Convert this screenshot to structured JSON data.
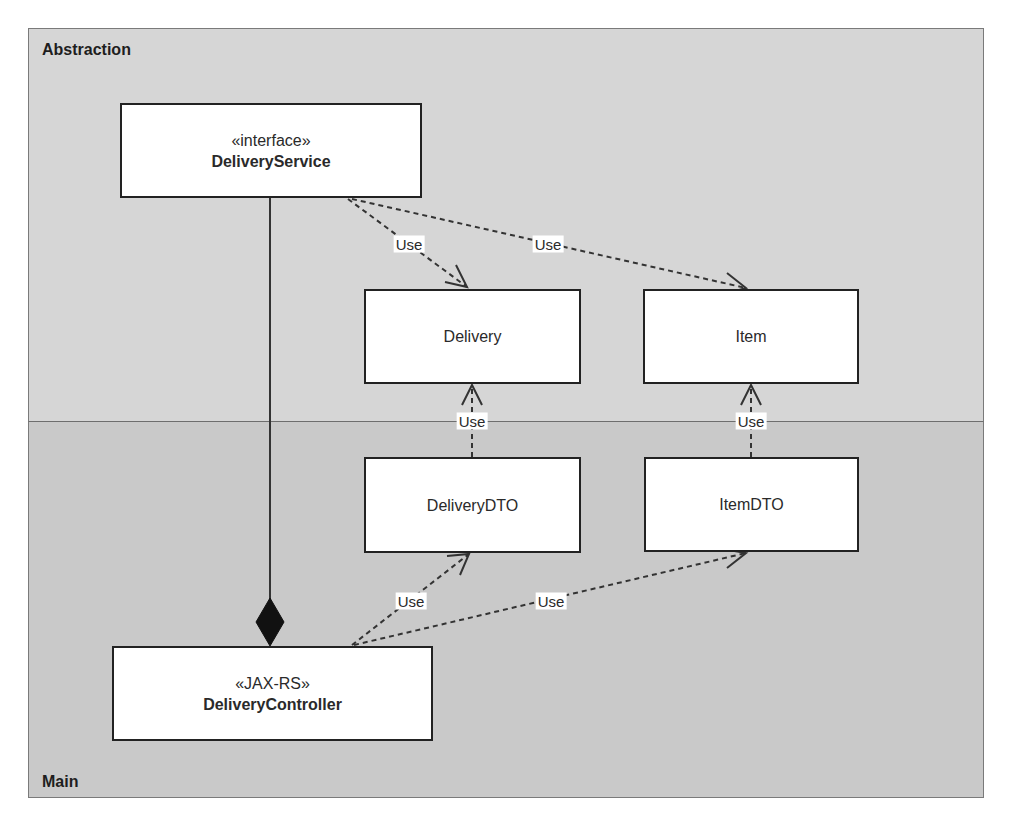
{
  "diagram": {
    "type": "UML class diagram",
    "packages": [
      {
        "id": "abstraction",
        "label": "Abstraction",
        "fill": "#d6d6d6"
      },
      {
        "id": "main",
        "label": "Main",
        "fill": "#c9c9c9"
      }
    ],
    "classes": {
      "delivery_service": {
        "stereotype": "«interface»",
        "name": "DeliveryService",
        "package": "Abstraction"
      },
      "delivery": {
        "name": "Delivery",
        "package": "Abstraction"
      },
      "item": {
        "name": "Item",
        "package": "Abstraction"
      },
      "delivery_dto": {
        "name": "DeliveryDTO",
        "package": "Main"
      },
      "item_dto": {
        "name": "ItemDTO",
        "package": "Main"
      },
      "delivery_controller": {
        "stereotype": "«JAX-RS»",
        "name": "DeliveryController",
        "package": "Main"
      }
    },
    "relations": [
      {
        "from": "DeliveryService",
        "to": "Delivery",
        "kind": "dependency",
        "label": "Use"
      },
      {
        "from": "DeliveryService",
        "to": "Item",
        "kind": "dependency",
        "label": "Use"
      },
      {
        "from": "DeliveryDTO",
        "to": "Delivery",
        "kind": "dependency",
        "label": "Use"
      },
      {
        "from": "ItemDTO",
        "to": "Item",
        "kind": "dependency",
        "label": "Use"
      },
      {
        "from": "DeliveryController",
        "to": "DeliveryDTO",
        "kind": "dependency",
        "label": "Use"
      },
      {
        "from": "DeliveryController",
        "to": "ItemDTO",
        "kind": "dependency",
        "label": "Use"
      },
      {
        "from": "DeliveryController",
        "to": "DeliveryService",
        "kind": "composition",
        "label": ""
      }
    ],
    "edge_labels": {
      "service_to_delivery": "Use",
      "service_to_item": "Use",
      "deliverydto_to_delivery": "Use",
      "itemdto_to_item": "Use",
      "controller_to_deliverydto": "Use",
      "controller_to_itemdto": "Use"
    },
    "colors": {
      "line": "#333333",
      "box_fill": "#ffffff",
      "box_border": "#222222"
    }
  }
}
